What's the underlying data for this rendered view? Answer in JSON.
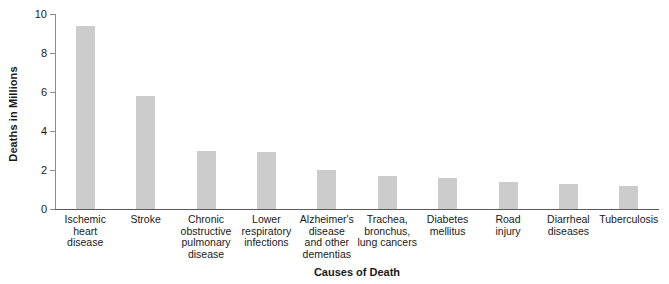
{
  "chart_data": {
    "type": "bar",
    "title": "",
    "xlabel": "Causes of Death",
    "ylabel": "Deaths in Millions",
    "ylim": [
      0,
      10
    ],
    "yticks": [
      0,
      2,
      4,
      6,
      8,
      10
    ],
    "ytick_labels": [
      "0",
      "2",
      "4",
      "6",
      "8",
      "10"
    ],
    "grid": false,
    "legend": "none",
    "bar_color": "#cccccc",
    "axis_color": "#5a5a5a",
    "categories": [
      "Ischemic heart disease",
      "Stroke",
      "Chronic obstructive pulmonary disease",
      "Lower respiratory infections",
      "Alzheimer's disease and other dementias",
      "Trachea, bronchus, lung cancers",
      "Diabetes mellitus",
      "Road injury",
      "Diarrheal diseases",
      "Tuberculosis"
    ],
    "category_lines": [
      [
        "Ischemic",
        "heart",
        "disease"
      ],
      [
        "Stroke"
      ],
      [
        "Chronic",
        "obstructive",
        "pulmonary",
        "disease"
      ],
      [
        "Lower",
        "respiratory",
        "infections"
      ],
      [
        "Alzheimer's",
        "disease",
        "and other",
        "dementias"
      ],
      [
        "Trachea,",
        "bronchus,",
        "lung cancers"
      ],
      [
        "Diabetes",
        "mellitus"
      ],
      [
        "Road",
        "injury"
      ],
      [
        "Diarrheal",
        "diseases"
      ],
      [
        "Tuberculosis"
      ]
    ],
    "values": [
      9.4,
      5.8,
      3.0,
      2.9,
      2.0,
      1.7,
      1.6,
      1.4,
      1.3,
      1.2
    ]
  }
}
